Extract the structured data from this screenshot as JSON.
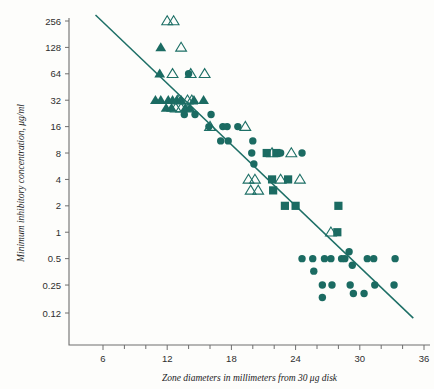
{
  "chart_data": {
    "type": "scatter",
    "title": "",
    "xlabel": "Zone diameters in millimeters from 30 μg disk",
    "ylabel": "Minimum inhibitory concentration, μg/ml",
    "yscale": "log2",
    "xlim": [
      5,
      37
    ],
    "ylim": [
      0.09,
      320
    ],
    "grid": false,
    "legend": "none",
    "accent_color": "#1b6b62",
    "axis_color": "#6e6e6e",
    "xticks": [
      6,
      12,
      18,
      24,
      30,
      36
    ],
    "xtick_labels": [
      "6",
      "12",
      "18",
      "24",
      "30",
      "36"
    ],
    "xminor_step": 2,
    "yticks": [
      256,
      128,
      64,
      32,
      16,
      8,
      4,
      2,
      1,
      0.5,
      0.25,
      0.12
    ],
    "ytick_labels": [
      "256",
      "128",
      "64",
      "32",
      "16",
      "8",
      "4",
      "2",
      "1",
      "0.5",
      "0.25",
      "0.12"
    ],
    "regression_line": {
      "x0": 5.3,
      "y0": 300,
      "x1": 35.0,
      "y1": 0.105
    },
    "series": [
      {
        "name": "filled-triangle",
        "marker": "triangle-filled",
        "points": [
          [
            11.4,
            128
          ],
          [
            11.3,
            64
          ],
          [
            10.9,
            32
          ],
          [
            11.4,
            32
          ],
          [
            12.1,
            32
          ],
          [
            12.5,
            32
          ],
          [
            12.9,
            32
          ],
          [
            13.3,
            32
          ],
          [
            14.5,
            32
          ],
          [
            15.4,
            32
          ],
          [
            11.9,
            26
          ],
          [
            12.4,
            26
          ],
          [
            13.7,
            26
          ],
          [
            14.1,
            26
          ]
        ]
      },
      {
        "name": "open-triangle",
        "marker": "triangle-open",
        "points": [
          [
            12.0,
            256
          ],
          [
            12.6,
            256
          ],
          [
            13.3,
            128
          ],
          [
            12.5,
            64
          ],
          [
            14.2,
            64
          ],
          [
            15.5,
            64
          ],
          [
            13.0,
            32
          ],
          [
            13.9,
            32
          ],
          [
            14.3,
            32
          ],
          [
            12.8,
            26
          ],
          [
            13.3,
            26
          ],
          [
            14.0,
            26
          ],
          [
            16.0,
            16
          ],
          [
            19.3,
            16
          ],
          [
            21.8,
            8
          ],
          [
            23.6,
            8
          ],
          [
            19.6,
            4
          ],
          [
            20.2,
            4
          ],
          [
            22.6,
            4
          ],
          [
            24.4,
            4
          ],
          [
            19.8,
            3
          ],
          [
            20.5,
            3
          ],
          [
            27.3,
            1
          ]
        ]
      },
      {
        "name": "filled-square",
        "marker": "square-filled",
        "points": [
          [
            21.3,
            8
          ],
          [
            22.2,
            8
          ],
          [
            21.8,
            4
          ],
          [
            23.3,
            4
          ],
          [
            21.9,
            3
          ],
          [
            23.0,
            2
          ],
          [
            24.0,
            2
          ],
          [
            28.0,
            2
          ],
          [
            27.9,
            1
          ]
        ]
      },
      {
        "name": "filled-circle",
        "marker": "circle-filled",
        "points": [
          [
            14.0,
            64
          ],
          [
            13.6,
            22
          ],
          [
            14.6,
            22
          ],
          [
            15.9,
            16
          ],
          [
            16.1,
            22
          ],
          [
            17.2,
            16
          ],
          [
            17.6,
            16
          ],
          [
            18.6,
            16
          ],
          [
            17.0,
            11
          ],
          [
            17.7,
            11
          ],
          [
            19.9,
            8
          ],
          [
            20.0,
            11
          ],
          [
            20.1,
            6
          ],
          [
            22.6,
            8
          ],
          [
            24.6,
            8
          ],
          [
            24.6,
            0.5
          ],
          [
            25.6,
            0.5
          ],
          [
            25.7,
            0.36
          ],
          [
            26.7,
            0.5
          ],
          [
            27.3,
            0.5
          ],
          [
            28.3,
            0.5
          ],
          [
            28.6,
            0.5
          ],
          [
            29.0,
            0.6
          ],
          [
            29.3,
            0.42
          ],
          [
            30.7,
            0.5
          ],
          [
            31.3,
            0.5
          ],
          [
            33.3,
            0.5
          ],
          [
            26.5,
            0.25
          ],
          [
            26.5,
            0.18
          ],
          [
            27.4,
            0.25
          ],
          [
            29.1,
            0.25
          ],
          [
            29.4,
            0.2
          ],
          [
            30.4,
            0.2
          ],
          [
            31.4,
            0.25
          ],
          [
            33.2,
            0.25
          ]
        ]
      }
    ]
  }
}
